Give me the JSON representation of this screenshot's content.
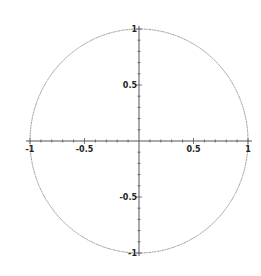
{
  "chart_data": {
    "type": "line",
    "title": "",
    "xlabel": "",
    "ylabel": "",
    "series": [
      {
        "name": "unit circle",
        "equation": "x^2 + y^2 = 1",
        "color": "#9a9a9a"
      }
    ],
    "xlim": [
      -1,
      1
    ],
    "ylim": [
      -1,
      1
    ],
    "x_ticks": [
      -1,
      -0.5,
      0.5,
      1
    ],
    "y_ticks": [
      -1,
      -0.5,
      0.5,
      1
    ],
    "x_tick_labels": [
      "-1",
      "-0.5",
      "0.5",
      "1"
    ],
    "y_tick_labels": [
      "-1",
      "-0.5",
      "0.5",
      "1"
    ],
    "minor_tick_step": 0.1,
    "grid": false,
    "legend": null
  },
  "style": {
    "axis_color": "#555555",
    "curve_color": "#9a9a9a",
    "label_color": "#222222"
  },
  "geometry": {
    "cx": 139,
    "cy": 141,
    "rx": 109,
    "ry": 112
  }
}
